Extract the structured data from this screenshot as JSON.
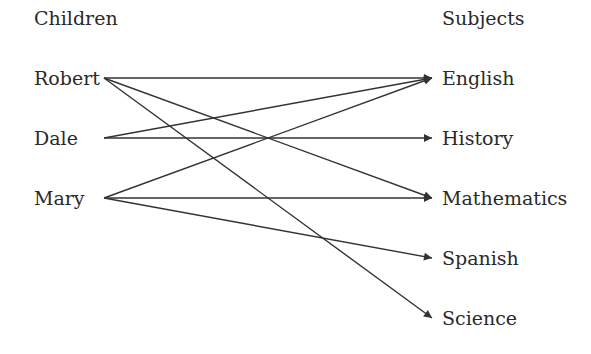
{
  "headers": {
    "left": "Children",
    "right": "Subjects"
  },
  "children": [
    {
      "id": "robert",
      "label": "Robert",
      "y": 78
    },
    {
      "id": "dale",
      "label": "Dale",
      "y": 138
    },
    {
      "id": "mary",
      "label": "Mary",
      "y": 198
    }
  ],
  "subjects": [
    {
      "id": "english",
      "label": "English",
      "y": 78
    },
    {
      "id": "history",
      "label": "History",
      "y": 138
    },
    {
      "id": "mathematics",
      "label": "Mathematics",
      "y": 198
    },
    {
      "id": "spanish",
      "label": "Spanish",
      "y": 258
    },
    {
      "id": "science",
      "label": "Science",
      "y": 318
    }
  ],
  "edges": [
    {
      "from": "robert",
      "to": "english"
    },
    {
      "from": "robert",
      "to": "mathematics"
    },
    {
      "from": "robert",
      "to": "science"
    },
    {
      "from": "dale",
      "to": "english"
    },
    {
      "from": "dale",
      "to": "history"
    },
    {
      "from": "mary",
      "to": "english"
    },
    {
      "from": "mary",
      "to": "mathematics"
    },
    {
      "from": "mary",
      "to": "spanish"
    }
  ],
  "colors": {
    "line": "#333333",
    "text": "#2a2a2a"
  }
}
